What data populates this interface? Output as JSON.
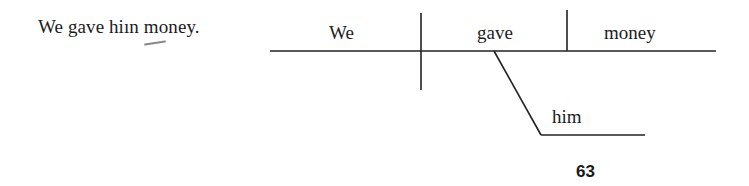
{
  "sentence": "We gave hiın money.",
  "diagram": {
    "subject": "We",
    "verb": "gave",
    "direct_object": "money",
    "indirect_object": "him"
  },
  "page_number": "63",
  "colors": {
    "ink": "#1c1c1c",
    "paper": "#ffffff"
  }
}
